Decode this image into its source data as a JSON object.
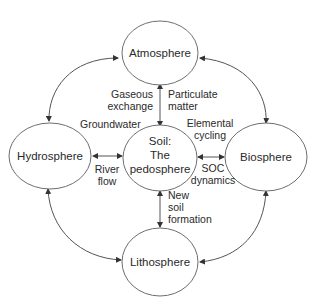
{
  "diagram": {
    "title": "",
    "nodes": {
      "atmosphere": {
        "label": "Atmosphere"
      },
      "hydrosphere": {
        "label": "Hydrosphere"
      },
      "soil": {
        "label_lines": [
          "Soil:",
          "The",
          "pedosphere"
        ]
      },
      "biosphere": {
        "label": "Biosphere"
      },
      "lithosphere": {
        "label": "Lithosphere"
      }
    },
    "edges": {
      "atmosphere_soil": {
        "left_label_lines": [
          "Gaseous",
          "exchange"
        ],
        "right_label_lines": [
          "Particulate",
          "matter"
        ]
      },
      "hydrosphere_soil": {
        "top_label": "Groundwater",
        "bottom_label_lines": [
          "River",
          "flow"
        ]
      },
      "soil_biosphere": {
        "top_label_lines": [
          "Elemental",
          "cycling"
        ],
        "bottom_label_lines": [
          "SOC",
          "dynamics"
        ]
      },
      "soil_lithosphere": {
        "label_lines": [
          "New",
          "soil",
          "formation"
        ]
      },
      "outer_ring": [
        {
          "from": "Atmosphere",
          "to": "Hydrosphere",
          "direction": "bidirectional"
        },
        {
          "from": "Atmosphere",
          "to": "Biosphere",
          "direction": "bidirectional"
        },
        {
          "from": "Hydrosphere",
          "to": "Lithosphere",
          "direction": "bidirectional"
        },
        {
          "from": "Biosphere",
          "to": "Lithosphere",
          "direction": "bidirectional"
        }
      ]
    },
    "colors": {
      "stroke": "#6e6e6e",
      "arrow": "#555555",
      "text": "#2a2a2a",
      "background": "#ffffff"
    }
  }
}
